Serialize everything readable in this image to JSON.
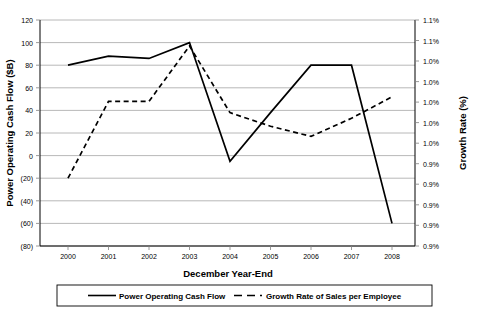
{
  "chart_data": {
    "type": "line",
    "title": "",
    "xlabel": "December Year-End",
    "ylabel": "Power Operating Cash Flow ($B)",
    "y2label": "Growth Rate (%)",
    "categories": [
      "2000",
      "2001",
      "2002",
      "2003",
      "2004",
      "2005",
      "2006",
      "2007",
      "2008"
    ],
    "ylim": [
      -80,
      120
    ],
    "ytick_labels": [
      "120",
      "100",
      "80",
      "60",
      "40",
      "20",
      "0",
      "(20)",
      "(40)",
      "(60)",
      "(80)"
    ],
    "ytick_values": [
      120,
      100,
      80,
      60,
      40,
      20,
      0,
      -20,
      -40,
      -60,
      -80
    ],
    "y2tick_labels": [
      "1.1%",
      "1.1%",
      "1.0%",
      "1.0%",
      "1.0%",
      "1.0%",
      "1.0%",
      "0.9%",
      "0.9%",
      "0.9%",
      "0.9%",
      "0.9%"
    ],
    "grid": true,
    "legend_position": "bottom",
    "series": [
      {
        "name": "Power Operating Cash Flow",
        "style": "solid",
        "axis": "left",
        "values": [
          80,
          88,
          86,
          100,
          -5,
          38,
          80,
          80,
          -60
        ]
      },
      {
        "name": "Growth Rate of Sales per Employee",
        "style": "dashed",
        "axis": "left",
        "values": [
          -20,
          48,
          48,
          97,
          38,
          26,
          17,
          33,
          52
        ]
      }
    ]
  },
  "legend": {
    "items": [
      {
        "label": "Power Operating Cash Flow",
        "style": "solid"
      },
      {
        "label": "Growth Rate of Sales per Employee",
        "style": "dashed"
      }
    ]
  },
  "axes": {
    "left_title": "Power Operating Cash Flow ($B)",
    "right_title": "Growth Rate (%)",
    "bottom_title": "December Year-End"
  }
}
